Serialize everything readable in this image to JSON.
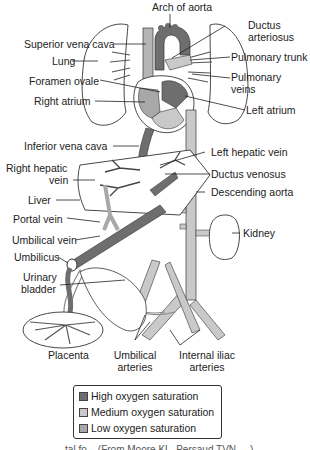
{
  "colors": {
    "high_oxygen": "#6e6e6e",
    "medium_oxygen": "#a8a8a8",
    "low_oxygen": "#c9c9c9",
    "outline": "#333333",
    "background": "#ffffff"
  },
  "labels": {
    "arch_of_aorta": "Arch of aorta",
    "ductus_arteriosus_1": "Ductus",
    "ductus_arteriosus_2": "arteriosus",
    "superior_vena_cava": "Superior vena cava",
    "pulmonary_trunk": "Pulmonary trunk",
    "lung": "Lung",
    "pulmonary_veins_1": "Pulmonary",
    "pulmonary_veins_2": "veins",
    "foramen_ovale": "Foramen ovale",
    "right_atrium": "Right atrium",
    "left_atrium": "Left atrium",
    "inferior_vena_cava": "Inferior vena cava",
    "left_hepatic_vein": "Left hepatic vein",
    "right_hepatic_vein_1": "Right hepatic",
    "right_hepatic_vein_2": "vein",
    "ductus_venosus": "Ductus venosus",
    "liver": "Liver",
    "descending_aorta": "Descending aorta",
    "portal_vein": "Portal vein",
    "kidney": "Kidney",
    "umbilical_vein": "Umbilical vein",
    "umbilicus": "Umbilicus",
    "urinary_bladder_1": "Urinary",
    "urinary_bladder_2": "bladder",
    "placenta": "Placenta",
    "umbilical_arteries_1": "Umbilical",
    "umbilical_arteries_2": "arteries",
    "internal_iliac_arteries_1": "Internal iliac",
    "internal_iliac_arteries_2": "arteries"
  },
  "legend": {
    "items": [
      {
        "label": "High oxygen saturation",
        "level": "high"
      },
      {
        "label": "Medium oxygen saturation",
        "level": "medium"
      },
      {
        "label": "Low oxygen saturation",
        "level": "low"
      }
    ]
  },
  "caption": "...tal fo... (From Moore KL, Persaud TVN, ...)"
}
